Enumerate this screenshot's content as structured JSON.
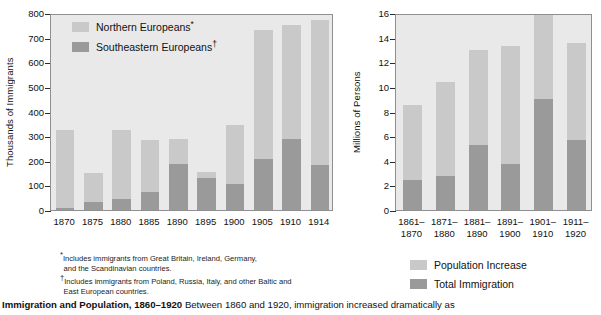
{
  "caption": {
    "title": "Immigration and Population, 1860–1920",
    "text": "Between 1860 and 1920, immigration increased dramatically as"
  },
  "footnotes": [
    {
      "marker": "*",
      "line1": "Includes immigrants from Great Britain, Ireland, Germany,",
      "line2": "and the Scandinavian countries."
    },
    {
      "marker": "†",
      "line1": "Includes immigrants from Poland, Russia, Italy, and other Baltic and",
      "line2": "East European countries."
    }
  ],
  "colors": {
    "light": "#c9c9c9",
    "dark": "#9a9a9a",
    "plot_bg": "#e9e9e9",
    "axis": "#2b2b2b"
  },
  "chart_data": [
    {
      "type": "bar",
      "id": "immigrant-origins",
      "title": "",
      "stacked": true,
      "xlabel": "",
      "ylabel": "Thousands of Immigrants",
      "ylim": [
        0,
        800
      ],
      "yticks": [
        "0",
        "100",
        "200",
        "300",
        "400",
        "500",
        "600",
        "700",
        "800"
      ],
      "grid": false,
      "legend_position": "inside-top-left",
      "categories": [
        "1870",
        "1875",
        "1880",
        "1885",
        "1890",
        "1895",
        "1900",
        "1905",
        "1910",
        "1914"
      ],
      "series": [
        {
          "name": "Southeastern Europeans",
          "footnote": "†",
          "color": "#9a9a9a",
          "values": [
            8,
            33,
            44,
            73,
            186,
            128,
            106,
            208,
            288,
            183
          ]
        },
        {
          "name": "Northern Europeans",
          "footnote": "*",
          "color": "#c9c9c9",
          "values": [
            317,
            117,
            282,
            213,
            101,
            26,
            239,
            522,
            464,
            588
          ]
        }
      ],
      "totals": [
        325,
        150,
        326,
        286,
        287,
        154,
        345,
        730,
        752,
        771
      ]
    },
    {
      "type": "bar",
      "id": "population-immigration",
      "title": "",
      "stacked": true,
      "xlabel": "",
      "ylabel": "Millions of Persons",
      "ylim": [
        0,
        16
      ],
      "yticks": [
        "0",
        "2",
        "4",
        "6",
        "8",
        "10",
        "12",
        "14",
        "16"
      ],
      "grid": false,
      "legend_position": "below",
      "categories": [
        "1861–1870",
        "1871–1880",
        "1881–1890",
        "1891–1900",
        "1901–1910",
        "1911–1920"
      ],
      "category_lines": [
        [
          "1861–",
          "1870"
        ],
        [
          "1871–",
          "1880"
        ],
        [
          "1881–",
          "1890"
        ],
        [
          "1891–",
          "1900"
        ],
        [
          "1901–",
          "1910"
        ],
        [
          "1911–",
          "1920"
        ]
      ],
      "series": [
        {
          "name": "Total Immigration",
          "color": "#9a9a9a",
          "values": [
            2.4,
            2.8,
            5.3,
            3.7,
            9.0,
            5.7
          ]
        },
        {
          "name": "Population Increase",
          "color": "#c9c9c9",
          "values": [
            6.1,
            7.6,
            7.7,
            9.6,
            6.8,
            7.9
          ]
        }
      ],
      "totals": [
        8.5,
        10.4,
        13.0,
        13.3,
        15.8,
        13.6
      ]
    }
  ]
}
